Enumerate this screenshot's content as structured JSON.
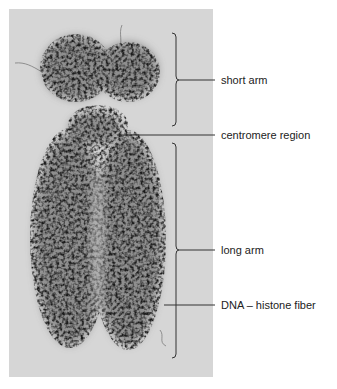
{
  "figure": {
    "colors": {
      "page_background": "#ffffff",
      "photo_background": "#d6d6d6",
      "chromatin_dark": "#2a2a2a",
      "label_text": "#222222",
      "leader_lines": "#333333"
    },
    "labels": [
      {
        "id": "short-arm",
        "text": "short arm"
      },
      {
        "id": "centromere-region",
        "text": "centromere region"
      },
      {
        "id": "long-arm",
        "text": "long arm"
      },
      {
        "id": "dna-histone-fiber",
        "text": "DNA – histone fiber"
      }
    ]
  }
}
